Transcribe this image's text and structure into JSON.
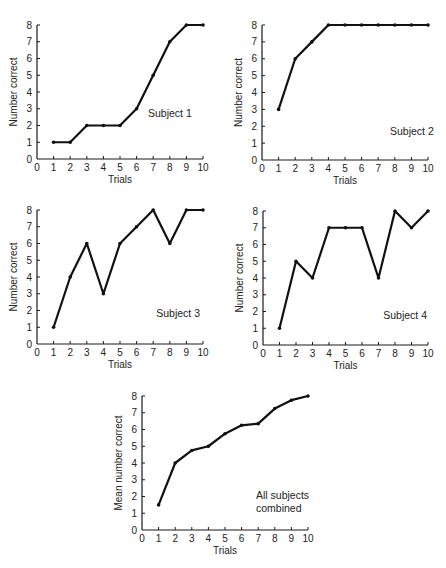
{
  "chart_data": [
    {
      "type": "line",
      "id": "subject-1",
      "xlabel": "Trials",
      "ylabel": "Number correct",
      "annotation": [
        "Subject 1"
      ],
      "x": [
        1,
        2,
        3,
        4,
        5,
        6,
        7,
        8,
        9,
        10
      ],
      "values": [
        1,
        1,
        2,
        2,
        2,
        3,
        5,
        7,
        8,
        8
      ],
      "xlim": [
        0,
        10
      ],
      "ylim": [
        0,
        8
      ],
      "xticks": [
        "0",
        "1",
        "2",
        "3",
        "4",
        "5",
        "6",
        "7",
        "8",
        "9",
        "10"
      ],
      "yticks": [
        "0",
        "1",
        "2",
        "3",
        "4",
        "5",
        "6",
        "7",
        "8"
      ],
      "grid": false
    },
    {
      "type": "line",
      "id": "subject-2",
      "xlabel": "Trials",
      "ylabel": "Number correct",
      "annotation": [
        "Subject 2"
      ],
      "x": [
        1,
        2,
        3,
        4,
        5,
        6,
        7,
        8,
        9,
        10
      ],
      "values": [
        3,
        6,
        7,
        8,
        8,
        8,
        8,
        8,
        8,
        8
      ],
      "xlim": [
        0,
        10
      ],
      "ylim": [
        0,
        8
      ],
      "xticks": [
        "0",
        "1",
        "2",
        "3",
        "4",
        "5",
        "6",
        "7",
        "8",
        "9",
        "10"
      ],
      "yticks": [
        "0",
        "1",
        "2",
        "3",
        "4",
        "5",
        "6",
        "7",
        "8"
      ],
      "grid": false
    },
    {
      "type": "line",
      "id": "subject-3",
      "xlabel": "Trials",
      "ylabel": "Number correct",
      "annotation": [
        "Subject 3"
      ],
      "x": [
        1,
        2,
        3,
        4,
        5,
        6,
        7,
        8,
        9,
        10
      ],
      "values": [
        1,
        4,
        6,
        3,
        6,
        7,
        8,
        6,
        8,
        8
      ],
      "xlim": [
        0,
        10
      ],
      "ylim": [
        0,
        8
      ],
      "xticks": [
        "0",
        "1",
        "2",
        "3",
        "4",
        "5",
        "6",
        "7",
        "8",
        "9",
        "10"
      ],
      "yticks": [
        "0",
        "1",
        "2",
        "3",
        "4",
        "5",
        "6",
        "7",
        "8"
      ],
      "grid": false
    },
    {
      "type": "line",
      "id": "subject-4",
      "xlabel": "Trials",
      "ylabel": "Number correct",
      "annotation": [
        "Subject 4"
      ],
      "x": [
        1,
        2,
        3,
        4,
        5,
        6,
        7,
        8,
        9,
        10
      ],
      "values": [
        1,
        5,
        4,
        7,
        7,
        7,
        4,
        8,
        7,
        8
      ],
      "xlim": [
        0,
        10
      ],
      "ylim": [
        0,
        8
      ],
      "xticks": [
        "0",
        "1",
        "2",
        "3",
        "4",
        "5",
        "6",
        "7",
        "8",
        "9",
        "10"
      ],
      "yticks": [
        "0",
        "1",
        "2",
        "3",
        "4",
        "5",
        "6",
        "7",
        "8"
      ],
      "grid": false
    },
    {
      "type": "line",
      "id": "all-subjects",
      "xlabel": "Trials",
      "ylabel": "Mean number correct",
      "annotation": [
        "All subjects",
        "combined"
      ],
      "x": [
        1,
        2,
        3,
        4,
        5,
        6,
        7,
        8,
        9,
        10
      ],
      "values": [
        1.5,
        4.0,
        4.75,
        5.0,
        5.75,
        6.25,
        6.35,
        7.25,
        7.75,
        8.0
      ],
      "xlim": [
        0,
        10
      ],
      "ylim": [
        0,
        8
      ],
      "xticks": [
        "0",
        "1",
        "2",
        "3",
        "4",
        "5",
        "6",
        "7",
        "8",
        "9",
        "10"
      ],
      "yticks": [
        "0",
        "1",
        "2",
        "3",
        "4",
        "5",
        "6",
        "7",
        "8"
      ],
      "grid": false
    }
  ]
}
